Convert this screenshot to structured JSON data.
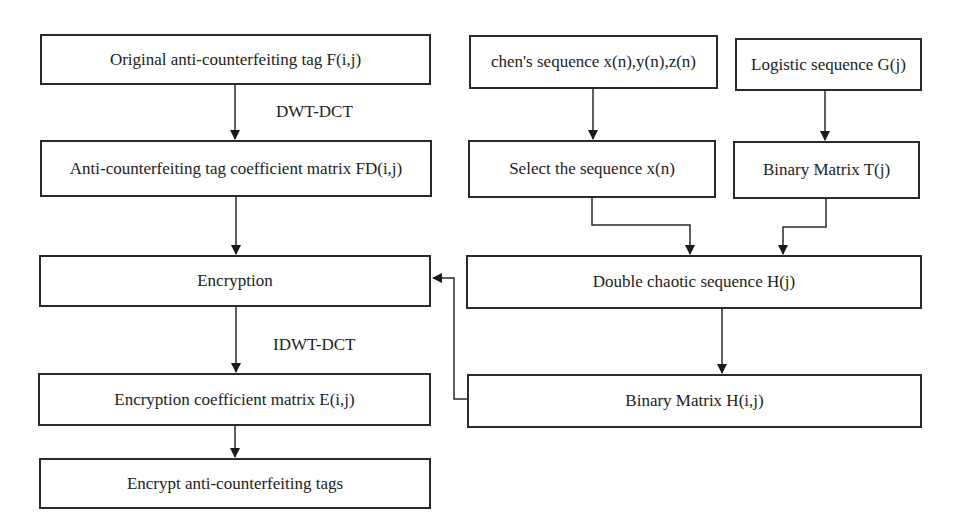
{
  "diagram": {
    "left_column": [
      {
        "id": "original-tag",
        "label": "Original anti-counterfeiting tag F(i,j)"
      },
      {
        "id": "coefficient-matrix-fd",
        "label": "Anti-counterfeiting tag coefficient matrix FD(i,j)"
      },
      {
        "id": "encryption",
        "label": "Encryption"
      },
      {
        "id": "encryption-coefficient-matrix",
        "label": "Encryption coefficient matrix E(i,j)"
      },
      {
        "id": "encrypt-tags",
        "label": "Encrypt anti-counterfeiting tags"
      }
    ],
    "right_column": [
      {
        "id": "chen-sequence",
        "label": "chen's sequence x(n),y(n),z(n)"
      },
      {
        "id": "logistic-sequence",
        "label": "Logistic sequence G(j)"
      },
      {
        "id": "select-sequence",
        "label": "Select the sequence x(n)"
      },
      {
        "id": "binary-matrix-t",
        "label": "Binary Matrix T(j)"
      },
      {
        "id": "double-chaotic",
        "label": "Double chaotic sequence H(j)"
      },
      {
        "id": "binary-matrix-h",
        "label": "Binary Matrix H(i,j)"
      }
    ],
    "edge_labels": {
      "dwt_dct": "DWT-DCT",
      "idwt_dct": "IDWT-DCT"
    },
    "edges": [
      {
        "from": "original-tag",
        "to": "coefficient-matrix-fd",
        "label": "DWT-DCT"
      },
      {
        "from": "coefficient-matrix-fd",
        "to": "encryption"
      },
      {
        "from": "encryption",
        "to": "encryption-coefficient-matrix",
        "label": "IDWT-DCT"
      },
      {
        "from": "encryption-coefficient-matrix",
        "to": "encrypt-tags"
      },
      {
        "from": "chen-sequence",
        "to": "select-sequence"
      },
      {
        "from": "logistic-sequence",
        "to": "binary-matrix-t"
      },
      {
        "from": "select-sequence",
        "to": "double-chaotic"
      },
      {
        "from": "binary-matrix-t",
        "to": "double-chaotic"
      },
      {
        "from": "double-chaotic",
        "to": "binary-matrix-h"
      },
      {
        "from": "binary-matrix-h",
        "to": "encryption"
      }
    ]
  }
}
